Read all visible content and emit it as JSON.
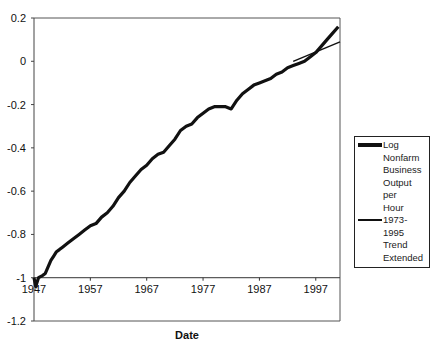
{
  "chart_data": {
    "type": "line",
    "title": "",
    "xlabel": "Date",
    "ylabel": "",
    "x_ticks": [
      "1947",
      "1957",
      "1967",
      "1977",
      "1987",
      "1997"
    ],
    "y_ticks": [
      "0.2",
      "0",
      "-0.2",
      "-0.4",
      "-0.6",
      "-0.8",
      "-1",
      "-1.2"
    ],
    "xlim": [
      1947,
      2001.3
    ],
    "ylim": [
      -1.2,
      0.2
    ],
    "x_axis_crosses_at": -1,
    "grid": false,
    "legend_position": "right",
    "series": [
      {
        "name": "Log Nonfarm Business Output per Hour",
        "style": "thick",
        "x": [
          1947,
          1947.3,
          1947.8,
          1948.5,
          1949,
          1949.5,
          1950,
          1950.5,
          1951,
          1951.5,
          1952,
          1953,
          1954,
          1955,
          1956,
          1957,
          1958,
          1959,
          1960,
          1961,
          1962,
          1963,
          1964,
          1965,
          1966,
          1967,
          1968,
          1969,
          1970,
          1971,
          1972,
          1973,
          1974,
          1975,
          1976,
          1977,
          1978,
          1979,
          1980,
          1981,
          1982,
          1983,
          1984,
          1985,
          1986,
          1987,
          1988,
          1989,
          1990,
          1991,
          1992,
          1993,
          1994,
          1995,
          1996,
          1997,
          1998,
          1999,
          2000,
          2001
        ],
        "values": [
          -1.0,
          -1.04,
          -1.0,
          -0.99,
          -0.98,
          -0.95,
          -0.92,
          -0.9,
          -0.88,
          -0.87,
          -0.86,
          -0.84,
          -0.82,
          -0.8,
          -0.78,
          -0.76,
          -0.75,
          -0.72,
          -0.7,
          -0.67,
          -0.63,
          -0.6,
          -0.56,
          -0.53,
          -0.5,
          -0.48,
          -0.45,
          -0.43,
          -0.42,
          -0.39,
          -0.36,
          -0.32,
          -0.3,
          -0.29,
          -0.26,
          -0.24,
          -0.22,
          -0.21,
          -0.21,
          -0.21,
          -0.22,
          -0.18,
          -0.15,
          -0.13,
          -0.11,
          -0.1,
          -0.09,
          -0.08,
          -0.06,
          -0.05,
          -0.03,
          -0.02,
          -0.01,
          0.0,
          0.02,
          0.04,
          0.07,
          0.1,
          0.13,
          0.16
        ]
      },
      {
        "name": "1973-1995 Trend Extended",
        "style": "thin",
        "x": [
          1993,
          2001.3
        ],
        "values": [
          0.0,
          0.09
        ]
      }
    ]
  },
  "legend": {
    "items": [
      {
        "label": "Log Nonfarm\nBusiness\nOutput per\nHour",
        "thickness": "4px"
      },
      {
        "label": "1973-1995\nTrend\nExtended",
        "thickness": "2px"
      }
    ]
  },
  "axes": {
    "x_title": "Date"
  }
}
